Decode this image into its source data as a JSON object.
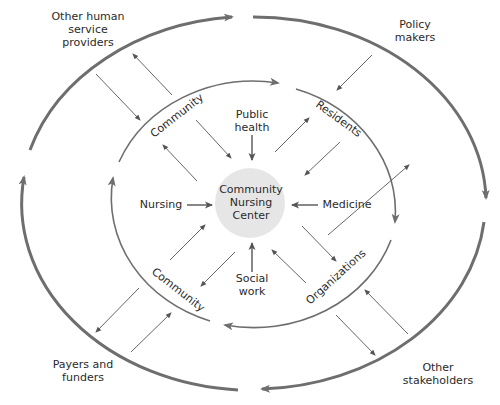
{
  "diagram": {
    "center": {
      "line1": "Community",
      "line2": "Nursing",
      "line3": "Center"
    },
    "disciplines": {
      "top": {
        "line1": "Public",
        "line2": "health"
      },
      "left": "Nursing",
      "right": "Medicine",
      "bottom": {
        "line1": "Social",
        "line2": "work"
      }
    },
    "inner_ring_labels": {
      "top_left": "Community",
      "top_right": "Residents",
      "bottom_left": "Community",
      "bottom_right": "Organizations"
    },
    "outer_labels": {
      "top_left": {
        "line1": "Other human",
        "line2": "service",
        "line3": "providers"
      },
      "top_right": {
        "line1": "Policy",
        "line2": "makers"
      },
      "bottom_left": {
        "line1": "Payers and",
        "line2": "funders"
      },
      "bottom_right": {
        "line1": "Other",
        "line2": "stakeholders"
      }
    },
    "colors": {
      "line": "#6e6e6e",
      "thin": "#555555",
      "center_fill": "#e6e6e6",
      "text": "#2a2a2a"
    }
  }
}
